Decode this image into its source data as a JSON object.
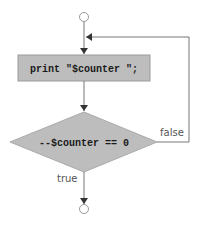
{
  "diagram": {
    "type": "flowchart",
    "nodes": [
      {
        "id": "start",
        "shape": "circle"
      },
      {
        "id": "action",
        "shape": "rectangle",
        "text": "print \"$counter \";"
      },
      {
        "id": "decision",
        "shape": "diamond",
        "text": "--$counter == 0"
      },
      {
        "id": "end",
        "shape": "circle"
      }
    ],
    "edges": [
      {
        "from": "start",
        "to": "action"
      },
      {
        "from": "action",
        "to": "decision"
      },
      {
        "from": "decision",
        "to": "end",
        "label": "true"
      },
      {
        "from": "decision",
        "to": "action",
        "label": "false"
      }
    ],
    "labels": {
      "action_text": "print \"$counter \";",
      "decision_text": "--$counter == 0",
      "true_label": "true",
      "false_label": "false"
    },
    "colors": {
      "fill": "#bdbdbd",
      "stroke": "#888888",
      "line": "#777777",
      "circle": "#999999"
    }
  }
}
